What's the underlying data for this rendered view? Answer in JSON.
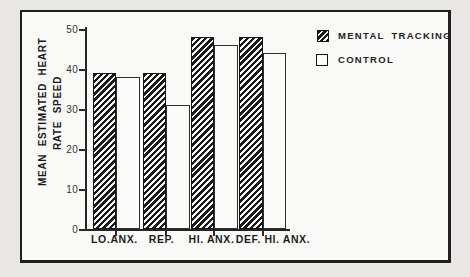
{
  "chart_data": {
    "type": "bar",
    "title": "",
    "categories": [
      "LO.ANX.",
      "REP.",
      "HI. ANX.",
      "DEF. HI. ANX."
    ],
    "series": [
      {
        "name": "MENTAL TRACKING",
        "swatch": "hatched",
        "values": [
          39,
          39,
          48,
          48
        ]
      },
      {
        "name": "CONTROL",
        "swatch": "open",
        "values": [
          38,
          31,
          46,
          44
        ]
      }
    ],
    "ylabel": "MEAN ESTIMATED HEART RATE SPEED",
    "ylabel_lines": [
      "MEAN ESTIMATED HEART",
      "RATE SPEED"
    ],
    "xlabel": "",
    "ylim": [
      0,
      50
    ],
    "yticks": [
      0,
      10,
      20,
      30,
      40,
      50
    ],
    "grid": false,
    "legend_position": "top-right"
  },
  "legend": {
    "items": [
      {
        "label": "MENTAL TRACKING",
        "swatch": "hatched"
      },
      {
        "label": "CONTROL",
        "swatch": "open"
      }
    ]
  },
  "colors": {
    "ink": "#1c1c1c",
    "paper": "#f9f9f7",
    "page_bg": "#e8e7e5",
    "bar_fill": "#fbfbf9",
    "hatch": "#1a1a1a"
  }
}
